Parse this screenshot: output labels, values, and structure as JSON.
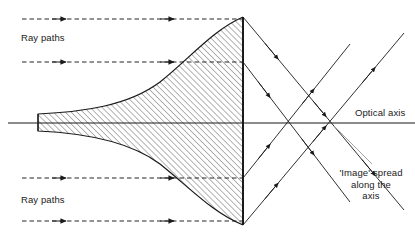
{
  "figure": {
    "name": "spherical-aberration-lens-diagram",
    "background_color": "#ffffff",
    "line_color": "#1a1a1a",
    "hatch_color": "#555555",
    "width": 415,
    "height": 247
  },
  "labels": {
    "ray_paths_top": "Ray paths",
    "ray_paths_bottom": "Ray paths",
    "optical_axis": "Optical axis",
    "image_spread_line1": "'Image' spread",
    "image_spread_line2": "along the",
    "image_spread_line3": "axis"
  },
  "optics": {
    "axis": {
      "y": 123,
      "x_start": 8,
      "x_end": 415
    },
    "lens": {
      "flat_face_x": 243,
      "top_apex_y": 17,
      "bottom_apex_y": 225,
      "waist_left_x": 38,
      "waist_top_y": 114,
      "waist_bottom_y": 131,
      "fill": "hatched-45deg"
    },
    "incoming_rays": [
      {
        "id": "ray-1",
        "y": 19,
        "x_start": 22,
        "x_end": 243,
        "style": "dashed",
        "arrows_at": [
          62,
          172
        ]
      },
      {
        "id": "ray-2",
        "y": 62,
        "x_start": 22,
        "x_end": 243,
        "style": "dashed",
        "arrows_at": [
          62,
          172
        ]
      },
      {
        "id": "ray-3",
        "y": 178,
        "x_start": 22,
        "x_end": 243,
        "style": "dashed",
        "arrows_at": [
          62,
          172
        ]
      },
      {
        "id": "ray-4",
        "y": 221,
        "x_start": 22,
        "x_end": 243,
        "style": "dashed",
        "arrows_at": [
          62,
          172
        ]
      }
    ],
    "refracted_rays": [
      {
        "id": "refracted-1",
        "from_x": 243,
        "from_y": 17,
        "to_x": 404,
        "to_y": 210,
        "crosses_axis_x": 331
      },
      {
        "id": "refracted-2",
        "from_x": 243,
        "from_y": 62,
        "to_x": 350,
        "to_y": 202,
        "crosses_axis_x": 287
      },
      {
        "id": "refracted-3",
        "from_x": 243,
        "from_y": 178,
        "to_x": 350,
        "to_y": 44,
        "crosses_axis_x": 287
      },
      {
        "id": "refracted-4",
        "from_x": 243,
        "from_y": 225,
        "to_x": 404,
        "to_y": 33,
        "crosses_axis_x": 331
      }
    ],
    "focus_points_on_axis": [
      287,
      331
    ],
    "leader_line": {
      "from_x": 334,
      "from_y": 126,
      "to_x": 372,
      "to_y": 164
    }
  }
}
